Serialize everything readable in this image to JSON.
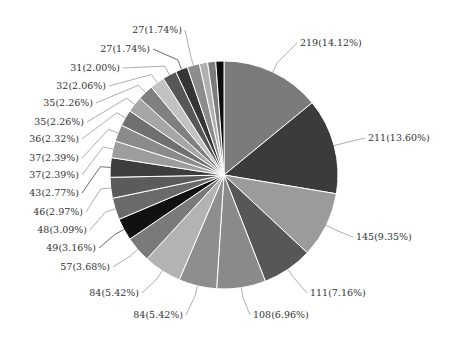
{
  "chart_data": {
    "type": "pie",
    "title": "",
    "start_angle_deg": 0,
    "direction": "clockwise",
    "center": [
      224,
      175
    ],
    "radius": 114,
    "slices": [
      {
        "value": 219,
        "label": "219(14.12%)",
        "color": "#7b7b7b",
        "lx": 300,
        "ly": 46,
        "anchor": "start"
      },
      {
        "value": 211,
        "label": "211(13.60%)",
        "color": "#3b3b3b",
        "lx": 368,
        "ly": 141,
        "anchor": "start"
      },
      {
        "value": 145,
        "label": "145(9.35%)",
        "color": "#9b9b9b",
        "lx": 356,
        "ly": 240,
        "anchor": "start"
      },
      {
        "value": 111,
        "label": "111(7.16%)",
        "color": "#575757",
        "lx": 310,
        "ly": 296,
        "anchor": "start"
      },
      {
        "value": 108,
        "label": "108(6.96%)",
        "color": "#8a8a8a",
        "lx": 253,
        "ly": 318,
        "anchor": "start"
      },
      {
        "value": 84,
        "label": "84(5.42%)",
        "color": "#8e8e8e",
        "lx": 183,
        "ly": 318,
        "anchor": "end"
      },
      {
        "value": 84,
        "label": "84(5.42%)",
        "color": "#b3b3b3",
        "lx": 139,
        "ly": 296,
        "anchor": "end"
      },
      {
        "value": 57,
        "label": "57(3.68%)",
        "color": "#7a7a7a",
        "lx": 110,
        "ly": 270,
        "anchor": "end"
      },
      {
        "value": 49,
        "label": "49(3.16%)",
        "color": "#111111",
        "lx": 96,
        "ly": 251,
        "anchor": "end"
      },
      {
        "value": 48,
        "label": "48(3.09%)",
        "color": "#6a6a6a",
        "lx": 87,
        "ly": 233,
        "anchor": "end"
      },
      {
        "value": 46,
        "label": "46(2.97%)",
        "color": "#5b5b5b",
        "lx": 83,
        "ly": 215,
        "anchor": "end"
      },
      {
        "value": 43,
        "label": "43(2.77%)",
        "color": "#3e3e3e",
        "lx": 79,
        "ly": 196,
        "anchor": "end"
      },
      {
        "value": 37,
        "label": "37(2.39%)",
        "color": "#9d9d9d",
        "lx": 79,
        "ly": 178,
        "anchor": "end"
      },
      {
        "value": 37,
        "label": "37(2.39%)",
        "color": "#8b8b8b",
        "lx": 79,
        "ly": 161,
        "anchor": "end"
      },
      {
        "value": 36,
        "label": "36(2.32%)",
        "color": "#707070",
        "lx": 79,
        "ly": 142,
        "anchor": "end"
      },
      {
        "value": 35,
        "label": "35(2.26%)",
        "color": "#a6a6a6",
        "lx": 84,
        "ly": 125,
        "anchor": "end"
      },
      {
        "value": 35,
        "label": "35(2.26%)",
        "color": "#808080",
        "lx": 93,
        "ly": 106,
        "anchor": "end"
      },
      {
        "value": 32,
        "label": "32(2.06%)",
        "color": "#c2c2c2",
        "lx": 106,
        "ly": 89,
        "anchor": "end"
      },
      {
        "value": 31,
        "label": "31(2.00%)",
        "color": "#575757",
        "lx": 120,
        "ly": 71,
        "anchor": "end"
      },
      {
        "value": 27,
        "label": "27(1.74%)",
        "color": "#353535",
        "lx": 150,
        "ly": 52,
        "anchor": "end"
      },
      {
        "value": 27,
        "label": "27(1.74%)",
        "color": "#8c8c8c",
        "lx": 182,
        "ly": 33,
        "anchor": "end"
      },
      {
        "value": 18,
        "label": "",
        "color": "#b0b0b0"
      },
      {
        "value": 18,
        "label": "",
        "color": "#7c7c7c"
      },
      {
        "value": 18,
        "label": "",
        "color": "#0d0d0d"
      }
    ],
    "categories": [
      "219",
      "211",
      "145",
      "111",
      "108",
      "84",
      "84",
      "57",
      "49",
      "48",
      "46",
      "43",
      "37",
      "37",
      "36",
      "35",
      "35",
      "32",
      "31",
      "27",
      "27"
    ],
    "values": [
      219,
      211,
      145,
      111,
      108,
      84,
      84,
      57,
      49,
      48,
      46,
      43,
      37,
      37,
      36,
      35,
      35,
      32,
      31,
      27,
      27
    ],
    "percentages": [
      14.12,
      13.6,
      9.35,
      7.16,
      6.96,
      5.42,
      5.42,
      3.68,
      3.16,
      3.09,
      2.97,
      2.77,
      2.39,
      2.39,
      2.32,
      2.26,
      2.26,
      2.06,
      2.0,
      1.74,
      1.74
    ],
    "legend": "none",
    "grid": false
  }
}
